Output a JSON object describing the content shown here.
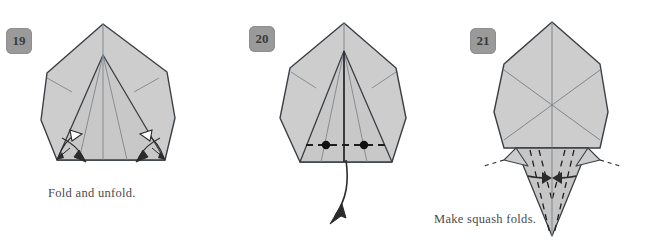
{
  "document": {
    "kind": "origami-instruction-diagram",
    "page_background": "#ffffff",
    "paper_fill": "#cdcdcd",
    "paper_fill_shaded": "#c4c4c4",
    "outline_color": "#3a3f45",
    "crease_color": "#8a8f95",
    "fold_line_color": "#222222",
    "badge_background": "#9a9a9a",
    "badge_text_color": "#3a3a3a",
    "caption_color": "#4a4a4a"
  },
  "panels": [
    {
      "id": "panel-19",
      "step_number": "19",
      "caption": "Fold and unfold.",
      "shape": "pentagonal-kite-with-center-pleat",
      "markings": {
        "arrow_pairs": 4,
        "solid_arrowheads": 2,
        "hollow_arrowheads": 2,
        "note": "fold-and-unfold arrows at both lower corners"
      }
    },
    {
      "id": "panel-20",
      "step_number": "20",
      "caption": "",
      "shape": "pentagonal-kite-with-center-pleat",
      "markings": {
        "dashed_fold_line": "horizontal valley fold across lower body",
        "reference_dots": 2,
        "pull_arrow": "long curved arrow pointing down and slightly left"
      }
    },
    {
      "id": "panel-21",
      "step_number": "21",
      "caption": "Make squash folds.",
      "shape": "hexagon-with-inverted-triangle-flap",
      "markings": {
        "squash_arrows": 2,
        "dashed_creases": 4,
        "note": "inward-facing squash fold arrows on the lower triangular flap"
      }
    }
  ]
}
